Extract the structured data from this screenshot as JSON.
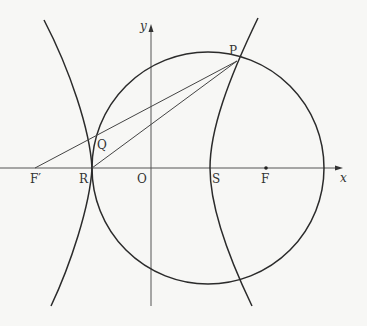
{
  "diagram": {
    "type": "geometry-figure",
    "axes": {
      "x_label": "x",
      "y_label": "y"
    },
    "points": {
      "P": "P",
      "Q": "Q",
      "R": "R",
      "O": "O",
      "S": "S",
      "F": "F",
      "F_prime": "F′"
    },
    "colors": {
      "stroke": "#2b2b2b",
      "axis": "#555555",
      "background": "#f7f7f5"
    }
  }
}
